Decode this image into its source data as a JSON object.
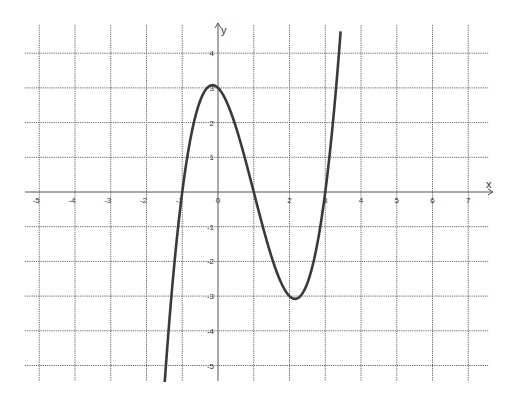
{
  "chart_data": {
    "type": "line",
    "title": "",
    "xlabel": "x",
    "ylabel": "y",
    "function": "x^3 - 3x^2 - x + 3",
    "roots": [
      -1,
      1,
      3
    ],
    "local_max": {
      "x": -0.15,
      "y": 3.08
    },
    "local_min": {
      "x": 2.15,
      "y": -3.08
    },
    "y_intercept": 3,
    "xlim": [
      -5.5,
      7.7
    ],
    "ylim": [
      -5.4,
      4.8
    ],
    "x_ticks": [
      -5,
      -4,
      -3,
      -2,
      -1,
      0,
      2,
      3,
      4,
      5,
      6,
      7
    ],
    "x_tick_labels": [
      "-5",
      "-4",
      "-3",
      "-2",
      "-1",
      "0",
      "2",
      "3",
      "4",
      "5",
      "6",
      "7"
    ],
    "y_ticks": [
      4,
      3,
      2,
      1,
      -1,
      -2,
      -3,
      -4,
      -5
    ],
    "y_tick_labels": [
      "4",
      "3",
      "2",
      "1",
      "-1",
      "-2",
      "-3",
      "-4",
      "-5"
    ],
    "grid_x": [
      -5,
      -4,
      -3,
      -2,
      -1,
      0,
      1,
      2,
      3,
      4,
      5,
      6,
      7
    ],
    "grid_y": [
      4,
      3,
      2,
      1,
      0,
      -1,
      -2,
      -3,
      -4,
      -5
    ],
    "grid": true,
    "legend": "none",
    "series": [
      {
        "name": "f(x)",
        "x": [
          -1.5,
          -1.25,
          -1,
          -0.75,
          -0.5,
          -0.25,
          0,
          0.25,
          0.5,
          0.75,
          1,
          1.25,
          1.5,
          1.75,
          2,
          2.15,
          2.25,
          2.5,
          2.75,
          3,
          3.25,
          3.43
        ],
        "y": [
          -5.625,
          -2.39,
          0,
          1.66,
          2.63,
          3.0,
          3,
          2.58,
          1.88,
          1.02,
          0,
          -0.98,
          -1.88,
          -2.58,
          -3,
          -3.08,
          -3.05,
          -2.63,
          -1.66,
          0,
          2.39,
          4.59
        ]
      }
    ],
    "colors": {
      "curve": "#3a3a3a",
      "grid": "#666666",
      "axis": "#555555"
    }
  }
}
